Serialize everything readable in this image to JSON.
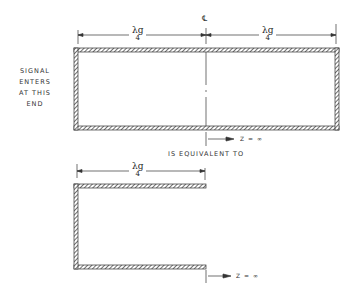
{
  "diagram": {
    "signal_label": [
      "SIGNAL",
      "ENTERS",
      "AT THIS",
      "END"
    ],
    "centerline_symbol": "℄",
    "dimension_top_left": {
      "numerator": "λg",
      "denominator": "4"
    },
    "dimension_top_right": {
      "numerator": "λg",
      "denominator": "4"
    },
    "dimension_bottom": {
      "numerator": "λg",
      "denominator": "4"
    },
    "impedance_top": "Z = ∞",
    "impedance_bottom": "Z = ∞",
    "equivalence_label": "IS EQUIVALENT TO"
  }
}
